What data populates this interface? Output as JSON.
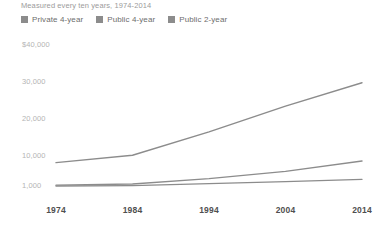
{
  "subtitle": "Measured every ten years, 1974-2014",
  "legend": {
    "items": [
      {
        "label": "Private 4-year",
        "color": "#8c8c8c"
      },
      {
        "label": "Public 4-year",
        "color": "#8c8c8c"
      },
      {
        "label": "Public 2-year",
        "color": "#8c8c8c"
      }
    ]
  },
  "axes": {
    "y_ticks": [
      "$40,000",
      "30,000",
      "20,000",
      "10,000",
      "1,000"
    ],
    "x_ticks": [
      "1974",
      "1984",
      "1994",
      "2004",
      "2014"
    ]
  },
  "chart_data": {
    "type": "line",
    "title": "",
    "subtitle": "Measured every ten years, 1974-2014",
    "xlabel": "",
    "ylabel": "",
    "categories": [
      "1974",
      "1984",
      "1994",
      "2004",
      "2014"
    ],
    "x": [
      1974,
      1984,
      1994,
      2004,
      2014
    ],
    "y_tick_values": [
      40000,
      30000,
      20000,
      10000,
      1000
    ],
    "y_tick_labels": [
      "$40,000",
      "30,000",
      "20,000",
      "10,000",
      "1,000"
    ],
    "ylim": [
      1000,
      40000
    ],
    "grid": false,
    "legend_position": "top-left",
    "series": [
      {
        "name": "Private 4-year",
        "color": "#8c8c8c",
        "values": [
          8000,
          10200,
          16500,
          23500,
          29800
        ]
      },
      {
        "name": "Public 4-year",
        "color": "#8c8c8c",
        "values": [
          1250,
          1600,
          3200,
          5400,
          8500
        ]
      },
      {
        "name": "Public 2-year",
        "color": "#8c8c8c",
        "values": [
          1000,
          1100,
          1700,
          2300,
          3000
        ]
      }
    ]
  }
}
